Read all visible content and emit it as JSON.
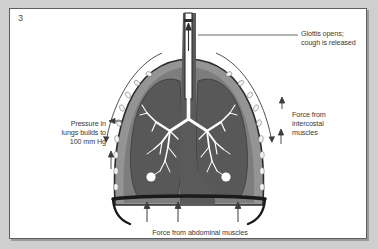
{
  "panel": {
    "number": "3",
    "background_color": "#ffffff",
    "page_color": "#cfcfcf",
    "border_color": "#5e5e5e"
  },
  "labels": {
    "pressure": "Pressure in\nlungs builds to\n100 mm Hg",
    "glottis": "Glottis opens;\ncough is released",
    "intercostal": "Force from\nintercostal\nmuscles",
    "abdominal": "Force from abdominal muscles"
  },
  "anatomy": {
    "chest_wall_color": "#949494",
    "lung_color": "#585858",
    "bronchial_color": "#ffffff",
    "trachea_color": "#5a5a5a",
    "diaphragm_color": "#1a1a1a",
    "rib_color": "#f2f2f2",
    "arrow_color": "#3d3d3d",
    "parts": [
      "trachea",
      "glottis",
      "left-lung",
      "right-lung",
      "bronchial-tree",
      "alveolar-sac",
      "rib",
      "chest-wall",
      "diaphragm",
      "esophagus"
    ]
  },
  "arrows": {
    "airflow_direction": "up",
    "abdominal_count": 3,
    "abdominal_direction": "up",
    "intercostal_direction": "inward"
  }
}
